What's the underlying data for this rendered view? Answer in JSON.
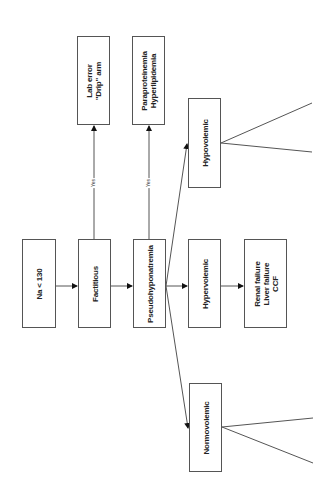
{
  "diagram": {
    "type": "flowchart",
    "orientation": "rotated-90-ccw",
    "nodes": {
      "na": {
        "label": "Na < 130"
      },
      "factitious": {
        "label": "Factitious"
      },
      "pseudo": {
        "label": "Pseudohyponatremia"
      },
      "hypervolemic": {
        "label": "Hypervolemic"
      },
      "hyper_causes": {
        "label": "Renal failure\nLiver failure\nCCF"
      },
      "lab_error": {
        "label": "Lab error\n\"Drip\" arm"
      },
      "paraproteinemia": {
        "label": "Paraproteinemia\nHyperlipidemia"
      },
      "hypovolemic": {
        "label": "Hypovolemic"
      },
      "normovolemic": {
        "label": "Normovolemic"
      }
    },
    "edge_labels": {
      "factitious_yes": "Yes",
      "pseudo_yes": "Yes"
    },
    "edges": [
      {
        "from": "na",
        "to": "factitious"
      },
      {
        "from": "factitious",
        "to": "pseudo"
      },
      {
        "from": "factitious",
        "to": "lab_error",
        "label": "Yes"
      },
      {
        "from": "pseudo",
        "to": "paraproteinemia",
        "label": "Yes"
      },
      {
        "from": "pseudo",
        "to": "hypervolemic"
      },
      {
        "from": "pseudo",
        "to": "hypovolemic"
      },
      {
        "from": "pseudo",
        "to": "normovolemic"
      },
      {
        "from": "hypervolemic",
        "to": "hyper_causes"
      },
      {
        "from": "hypovolemic",
        "to": "(truncated branch 1)"
      },
      {
        "from": "hypovolemic",
        "to": "(truncated branch 2)"
      },
      {
        "from": "normovolemic",
        "to": "(truncated branch 1)"
      },
      {
        "from": "normovolemic",
        "to": "(truncated branch 2)"
      }
    ]
  }
}
